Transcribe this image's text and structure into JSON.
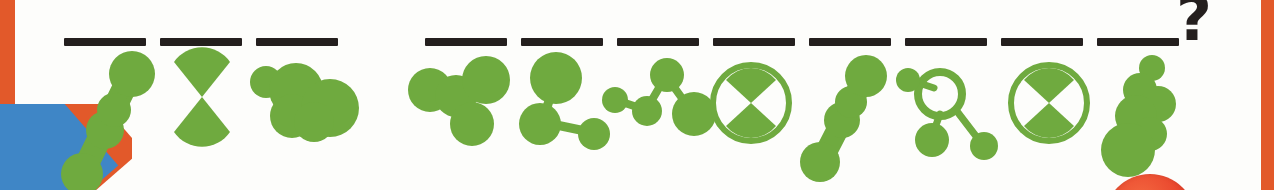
{
  "page": {
    "background_color": "#fdfdfb",
    "accent_orange": "#e2592a",
    "accent_blue": "#3f86c6",
    "molecule_green": "#6faa3f",
    "ink_black": "#241f1e",
    "red_sphere_color": "#e8412a"
  },
  "decorations": {
    "left_edge_name": "orange page edge",
    "right_edge_name": "orange page edge",
    "corner_name": "blue and orange corner wedge",
    "red_sphere_name": "red sphere"
  },
  "prompt": {
    "question_mark": "?"
  },
  "answer_blanks": {
    "count": 11,
    "group_one_count": 3,
    "group_two_count": 8,
    "items": [
      {
        "index": 1,
        "x": 64,
        "y": 38,
        "w": 82,
        "label": "blank-1"
      },
      {
        "index": 2,
        "x": 160,
        "y": 38,
        "w": 82,
        "label": "blank-2"
      },
      {
        "index": 3,
        "x": 256,
        "y": 38,
        "w": 82,
        "label": "blank-3"
      },
      {
        "index": 4,
        "x": 425,
        "y": 38,
        "w": 82,
        "label": "blank-4"
      },
      {
        "index": 5,
        "x": 521,
        "y": 38,
        "w": 82,
        "label": "blank-5"
      },
      {
        "index": 6,
        "x": 617,
        "y": 38,
        "w": 82,
        "label": "blank-6"
      },
      {
        "index": 7,
        "x": 713,
        "y": 38,
        "w": 82,
        "label": "blank-7"
      },
      {
        "index": 8,
        "x": 809,
        "y": 38,
        "w": 82,
        "label": "blank-8"
      },
      {
        "index": 9,
        "x": 905,
        "y": 38,
        "w": 82,
        "label": "blank-9"
      },
      {
        "index": 10,
        "x": 1001,
        "y": 38,
        "w": 82,
        "label": "blank-10"
      },
      {
        "index": 11,
        "x": 1097,
        "y": 38,
        "w": 82,
        "label": "blank-11"
      }
    ]
  },
  "molecules": {
    "count": 11,
    "items": [
      {
        "index": 1,
        "name": "blob-chain-diagonal",
        "x": 58,
        "y": 52,
        "w": 96,
        "h": 138,
        "kind": "chain"
      },
      {
        "index": 2,
        "name": "bowtie-hourglass",
        "x": 168,
        "y": 56,
        "w": 68,
        "h": 82,
        "kind": "bowtie"
      },
      {
        "index": 3,
        "name": "blob-cluster-wide",
        "x": 248,
        "y": 56,
        "w": 110,
        "h": 86,
        "kind": "cluster"
      },
      {
        "index": 4,
        "name": "three-node-bonded-group",
        "x": 408,
        "y": 60,
        "w": 110,
        "h": 88,
        "kind": "bonded"
      },
      {
        "index": 5,
        "name": "tri-node-branch",
        "x": 520,
        "y": 56,
        "w": 100,
        "h": 96,
        "kind": "branch"
      },
      {
        "index": 6,
        "name": "four-node-zigzag-chain",
        "x": 604,
        "y": 62,
        "w": 110,
        "h": 82,
        "kind": "zigzag"
      },
      {
        "index": 7,
        "name": "bowtie-in-ring",
        "x": 706,
        "y": 58,
        "w": 92,
        "h": 92,
        "kind": "bowtie-ring"
      },
      {
        "index": 8,
        "name": "blob-chain-diagonal-short",
        "x": 806,
        "y": 56,
        "w": 84,
        "h": 120,
        "kind": "chain2"
      },
      {
        "index": 9,
        "name": "open-ring-with-nodes",
        "x": 894,
        "y": 58,
        "w": 104,
        "h": 106,
        "kind": "ring-nodes"
      },
      {
        "index": 10,
        "name": "bowtie-in-ring",
        "x": 1004,
        "y": 58,
        "w": 92,
        "h": 92,
        "kind": "bowtie-ring"
      },
      {
        "index": 11,
        "name": "blob-cluster-vertical",
        "x": 1100,
        "y": 54,
        "w": 92,
        "h": 126,
        "kind": "vertical-cluster"
      }
    ]
  }
}
